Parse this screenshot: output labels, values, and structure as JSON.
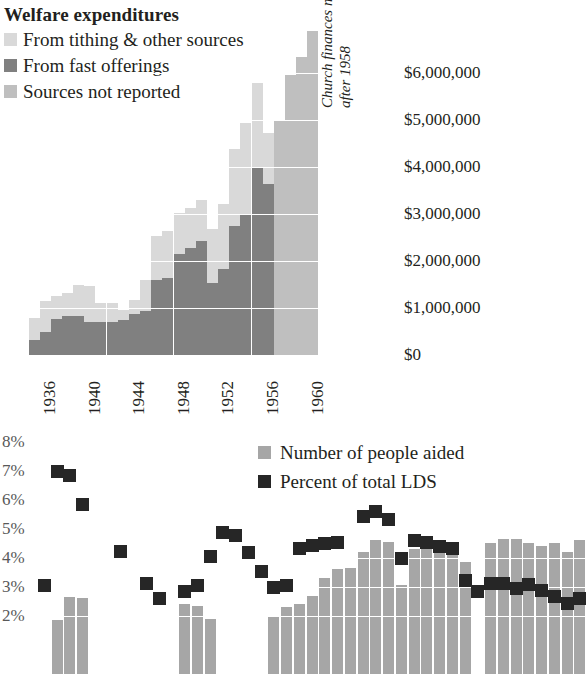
{
  "chart_data": [
    {
      "type": "bar",
      "title": "Welfare expenditures",
      "subtype": "stacked-column",
      "xlabel": "",
      "ylabel": "",
      "ylim": [
        0,
        7000000
      ],
      "grid": true,
      "annotation": "Church finances not publicly reported after 1958",
      "ytick_labels": [
        "$6,000,000",
        "$5,000,000",
        "$4,000,000",
        "$3,000,000",
        "$2,000,000",
        "$1,000,000",
        "$0"
      ],
      "ytick_values": [
        6000000,
        5000000,
        4000000,
        3000000,
        2000000,
        1000000,
        0
      ],
      "xtick_labels": [
        "1936",
        "1940",
        "1944",
        "1948",
        "1952",
        "1956",
        "1960"
      ],
      "legend": [
        {
          "label": "From tithing & other sources",
          "color": "#d9d9d9"
        },
        {
          "label": "From fast offerings",
          "color": "#808080"
        },
        {
          "label": "Sources not reported",
          "color": "#bfbfbf"
        }
      ],
      "categories": [
        1936,
        1937,
        1938,
        1939,
        1940,
        1941,
        1942,
        1943,
        1944,
        1945,
        1946,
        1947,
        1948,
        1949,
        1950,
        1951,
        1952,
        1953,
        1954,
        1955,
        1956,
        1957,
        1958,
        1959,
        1960,
        1961
      ],
      "series": [
        {
          "name": "From fast offerings",
          "color": "#808080",
          "values": [
            330000,
            500000,
            760000,
            830000,
            840000,
            700000,
            700000,
            700000,
            740000,
            880000,
            940000,
            1600000,
            1640000,
            2150000,
            2280000,
            2420000,
            1530000,
            1830000,
            2740000,
            3000000,
            3980000,
            3640000,
            null,
            null,
            null,
            null
          ]
        },
        {
          "name": "From tithing & other sources",
          "color": "#d9d9d9",
          "values": [
            450000,
            640000,
            500000,
            480000,
            660000,
            770000,
            400000,
            400000,
            220000,
            280000,
            650000,
            930000,
            1000000,
            880000,
            850000,
            880000,
            1150000,
            1380000,
            1640000,
            1940000,
            1800000,
            1080000,
            null,
            null,
            null,
            null
          ]
        },
        {
          "name": "Sources not reported",
          "color": "#bfbfbf",
          "values": [
            null,
            null,
            null,
            null,
            null,
            null,
            null,
            null,
            null,
            null,
            null,
            null,
            null,
            null,
            null,
            null,
            null,
            null,
            null,
            null,
            null,
            null,
            5000000,
            5950000,
            6350000,
            6900000
          ]
        }
      ]
    },
    {
      "type": "bar",
      "subtype": "column-plus-scatter",
      "title": "",
      "xlabel": "",
      "ylabel": "",
      "ylim": [
        0,
        8.4
      ],
      "grid": true,
      "ytick_labels": [
        "8%",
        "7%",
        "6%",
        "5%",
        "4%",
        "3%",
        "2%"
      ],
      "ytick_values": [
        8,
        7,
        6,
        5,
        4,
        3,
        2
      ],
      "legend": [
        {
          "label": "Number of people aided",
          "color": "#a6a6a6"
        },
        {
          "label": "Percent of total LDS",
          "color": "#262626"
        }
      ],
      "series": [
        {
          "name": "Percent of total LDS",
          "color": "#262626",
          "kind": "scatter",
          "values": [
            3.05,
            7.0,
            6.85,
            5.85,
            null,
            null,
            4.25,
            null,
            3.15,
            2.6,
            null,
            2.85,
            3.05,
            4.05,
            4.9,
            4.8,
            4.2,
            3.55,
            3.0,
            3.05,
            4.35,
            4.45,
            4.5,
            4.55,
            null,
            5.45,
            5.6,
            5.35,
            4.0,
            4.6,
            4.55,
            4.4,
            4.35,
            3.25,
            2.85,
            3.15,
            3.15,
            2.95,
            3.1,
            2.9,
            2.7,
            2.45,
            2.6
          ]
        },
        {
          "name": "Number of people aided",
          "color": "#a6a6a6",
          "kind": "bar",
          "values": [
            null,
            1.85,
            2.65,
            2.6,
            null,
            null,
            null,
            null,
            null,
            null,
            null,
            2.4,
            2.35,
            1.9,
            null,
            null,
            null,
            null,
            2.0,
            2.3,
            2.4,
            2.7,
            3.3,
            3.6,
            3.65,
            4.2,
            4.6,
            4.55,
            3.05,
            4.3,
            4.4,
            4.55,
            4.5,
            3.85,
            null,
            4.5,
            4.65,
            4.65,
            4.5,
            4.4,
            4.5,
            4.2,
            4.6
          ]
        }
      ]
    }
  ],
  "top": {
    "title": "Welfare expenditures",
    "legend": [
      {
        "label": "From tithing & other sources"
      },
      {
        "label": "From fast offerings"
      },
      {
        "label": "Sources not reported"
      }
    ],
    "note": "Church finances not publicly reported after 1958",
    "ylabels": [
      "$6,000,000",
      "$5,000,000",
      "$4,000,000",
      "$3,000,000",
      "$2,000,000",
      "$1,000,000",
      "$0"
    ],
    "xlabels": [
      "1936",
      "1940",
      "1944",
      "1948",
      "1952",
      "1956",
      "1960"
    ]
  },
  "bottom": {
    "ylabels": [
      "8%",
      "7%",
      "6%",
      "5%",
      "4%",
      "3%",
      "2%"
    ],
    "legend": [
      {
        "label": "Number of people aided"
      },
      {
        "label": "Percent of total LDS"
      }
    ]
  },
  "colors": {
    "light": "#d9d9d9",
    "mid": "#bfbfbf",
    "dark": "#808080",
    "bar_bottom": "#a6a6a6",
    "dot": "#262626",
    "text": "#231f20",
    "axis_text": "#595959",
    "grid": "#ffffff"
  }
}
